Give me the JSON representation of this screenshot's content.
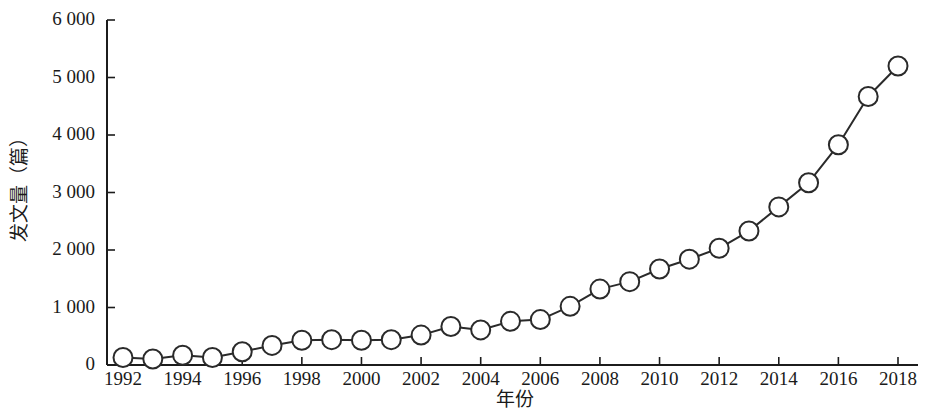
{
  "chart_data": {
    "type": "line",
    "title": "",
    "xlabel": "年份",
    "ylabel": "发文量（篇）",
    "x": [
      1992,
      1993,
      1994,
      1995,
      1996,
      1997,
      1998,
      1999,
      2000,
      2001,
      2002,
      2003,
      2004,
      2005,
      2006,
      2007,
      2008,
      2009,
      2010,
      2011,
      2012,
      2013,
      2014,
      2015,
      2016,
      2017,
      2018
    ],
    "values": [
      130,
      105,
      170,
      130,
      230,
      340,
      430,
      440,
      430,
      440,
      520,
      670,
      610,
      760,
      790,
      1020,
      1320,
      1450,
      1670,
      1840,
      2030,
      2330,
      2750,
      3170,
      3830,
      4670,
      5200
    ],
    "series": [
      {
        "name": "发文量",
        "values": [
          130,
          105,
          170,
          130,
          230,
          340,
          430,
          440,
          430,
          440,
          520,
          670,
          610,
          760,
          790,
          1020,
          1320,
          1450,
          1670,
          1840,
          2030,
          2330,
          2750,
          3170,
          3830,
          4670,
          5200
        ]
      }
    ],
    "xlim": [
      1991.3,
      1991.3
    ],
    "ylim": [
      0,
      6000
    ],
    "ytick_values": [
      0,
      1000,
      2000,
      3000,
      4000,
      5000,
      6000
    ],
    "ytick_labels": [
      "0",
      "1 000",
      "2 000",
      "3 000",
      "4 000",
      "5 000",
      "6 000"
    ],
    "xtick_values": [
      1992,
      1994,
      1996,
      1998,
      2000,
      2002,
      2004,
      2006,
      2008,
      2010,
      2012,
      2014,
      2016,
      2018
    ],
    "xtick_labels": [
      "1992",
      "1994",
      "1996",
      "1998",
      "2000",
      "2002",
      "2004",
      "2006",
      "2008",
      "2010",
      "2012",
      "2014",
      "2016",
      "2018"
    ],
    "grid": false,
    "legend": "none",
    "marker": "open-circle",
    "line_color": "#2a2a2a",
    "marker_fill": "#ffffff",
    "marker_edge_color": "#2a2a2a",
    "axis_color": "#1c1c1c",
    "background_color": "#ffffff"
  }
}
